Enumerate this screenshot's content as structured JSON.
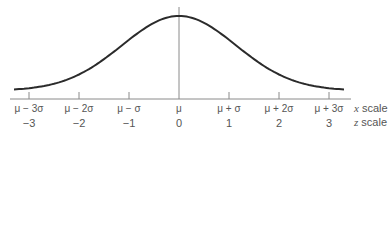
{
  "chart_data": {
    "type": "line",
    "title": "",
    "xlabel": "",
    "ylabel": "",
    "grid": false,
    "legend": "none",
    "z_range": [
      -3.3,
      3.3
    ],
    "mean_line": true,
    "ticks": [
      {
        "x_label": "μ − 3σ",
        "z_label": "−3",
        "z": -3
      },
      {
        "x_label": "μ − 2σ",
        "z_label": "−2",
        "z": -2
      },
      {
        "x_label": "μ − σ",
        "z_label": "−1",
        "z": -1
      },
      {
        "x_label": "μ",
        "z_label": "0",
        "z": 0
      },
      {
        "x_label": "μ + σ",
        "z_label": "1",
        "z": 1
      },
      {
        "x_label": "μ + 2σ",
        "z_label": "2",
        "z": 2
      },
      {
        "x_label": "μ + 3σ",
        "z_label": "3",
        "z": 3
      }
    ],
    "scale_labels": {
      "x_scale": {
        "var": "x",
        "text": " scale"
      },
      "z_scale": {
        "var": "z",
        "text": " scale"
      }
    }
  },
  "colors": {
    "curve": "#2b2b2b",
    "axis": "#8a8a8a",
    "tick": "#8a8a8a",
    "mean_line": "#8a8a8a",
    "text": "#555555"
  }
}
